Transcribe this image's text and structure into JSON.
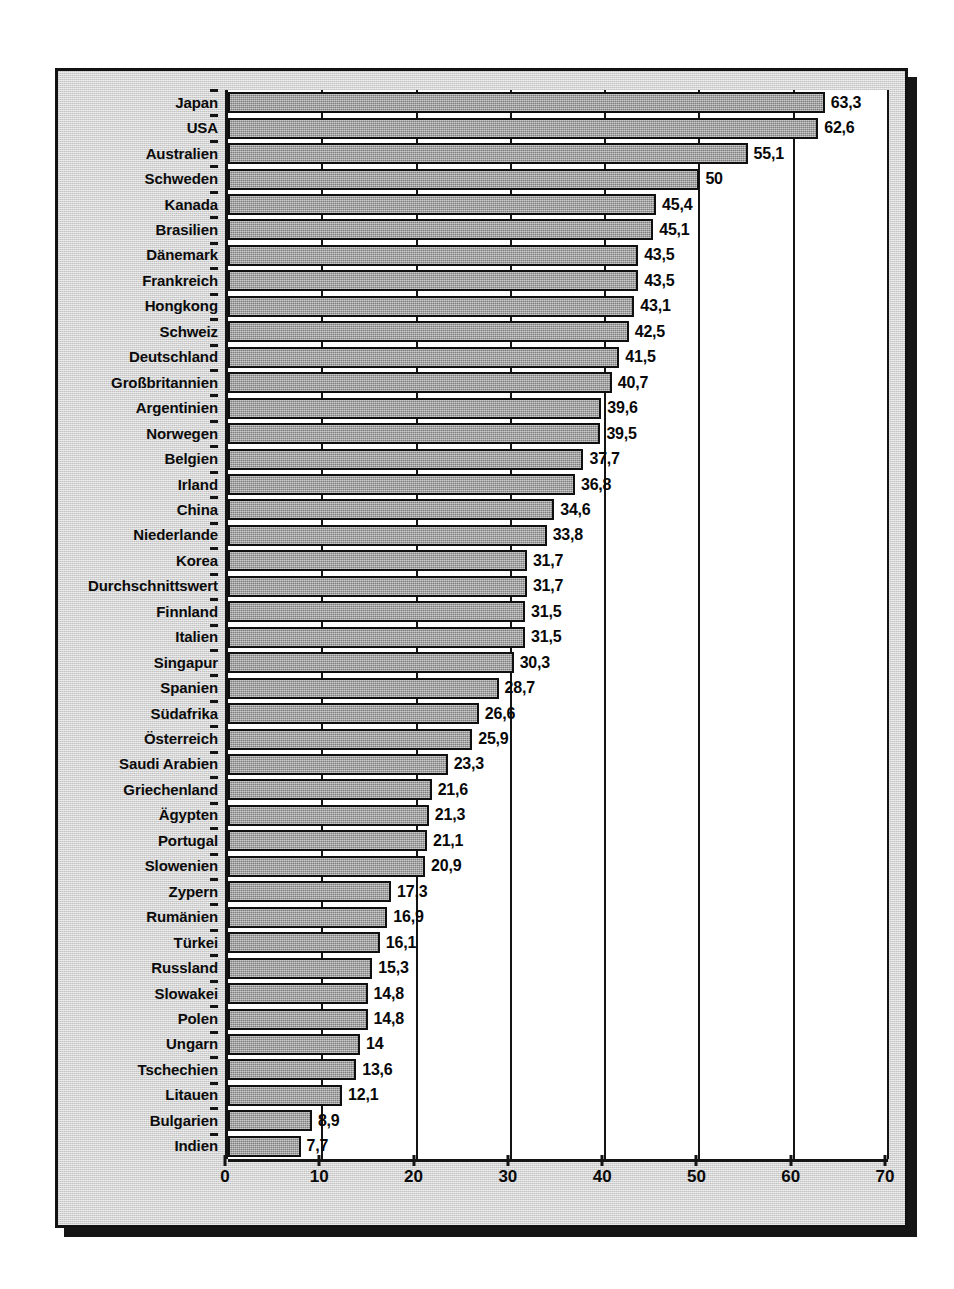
{
  "chart_data": {
    "type": "bar",
    "orientation": "horizontal",
    "title": "",
    "subtitle": "",
    "xlabel": "",
    "ylabel": "",
    "xlim": [
      0,
      70
    ],
    "xticks": [
      0,
      10,
      20,
      30,
      40,
      50,
      60,
      70
    ],
    "xtick_labels": [
      "0",
      "10",
      "20",
      "30",
      "40",
      "50",
      "60",
      "70"
    ],
    "grid": true,
    "grid_axis": "x",
    "legend": null,
    "decimal_separator": ",",
    "bar_color": "#9d9d9d",
    "bar_border_color": "#101010",
    "panel_background": "#cfcfcf",
    "plot_background": "#ffffff",
    "categories": [
      "Japan",
      "USA",
      "Australien",
      "Schweden",
      "Kanada",
      "Brasilien",
      "Dänemark",
      "Frankreich",
      "Hongkong",
      "Schweiz",
      "Deutschland",
      "Großbritannien",
      "Argentinien",
      "Norwegen",
      "Belgien",
      "Irland",
      "China",
      "Niederlande",
      "Korea",
      "Durchschnittswert",
      "Finnland",
      "Italien",
      "Singapur",
      "Spanien",
      "Südafrika",
      "Österreich",
      "Saudi Arabien",
      "Griechenland",
      "Ägypten",
      "Portugal",
      "Slowenien",
      "Zypern",
      "Rumänien",
      "Türkei",
      "Russland",
      "Slowakei",
      "Polen",
      "Ungarn",
      "Tschechien",
      "Litauen",
      "Bulgarien",
      "Indien"
    ],
    "values": [
      63.3,
      62.6,
      55.1,
      50,
      45.4,
      45.1,
      43.5,
      43.5,
      43.1,
      42.5,
      41.5,
      40.7,
      39.6,
      39.5,
      37.7,
      36.8,
      34.6,
      33.8,
      31.7,
      31.7,
      31.5,
      31.5,
      30.3,
      28.7,
      26.6,
      25.9,
      23.3,
      21.6,
      21.3,
      21.1,
      20.9,
      17.3,
      16.9,
      16.1,
      15.3,
      14.8,
      14.8,
      14,
      13.6,
      12.1,
      8.9,
      7.7
    ],
    "value_labels": [
      "63,3",
      "62,6",
      "55,1",
      "50",
      "45,4",
      "45,1",
      "43,5",
      "43,5",
      "43,1",
      "42,5",
      "41,5",
      "40,7",
      "39,6",
      "39,5",
      "37,7",
      "36,8",
      "34,6",
      "33,8",
      "31,7",
      "31,7",
      "31,5",
      "31,5",
      "30,3",
      "28,7",
      "26,6",
      "25,9",
      "23,3",
      "21,6",
      "21,3",
      "21,1",
      "20,9",
      "17,3",
      "16,9",
      "16,1",
      "15,3",
      "14,8",
      "14,8",
      "14",
      "13,6",
      "12,1",
      "8,9",
      "7,7"
    ]
  }
}
